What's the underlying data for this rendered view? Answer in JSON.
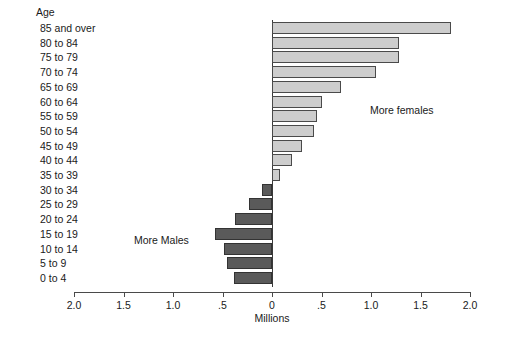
{
  "chart_data": {
    "type": "bar",
    "title": "",
    "subtitle": "",
    "orientation": "horizontal",
    "style": "population-pyramid-difference",
    "xlabel": "Millions",
    "ylabel": "Age",
    "grid": false,
    "legend_position": "none",
    "axis_tick_labels": [
      "2.0",
      "1.5",
      "1.0",
      ".5",
      "0",
      ".5",
      "1.0",
      "1.5",
      "2.0"
    ],
    "axis_tick_values": [
      -2.0,
      -1.5,
      -1.0,
      -0.5,
      0,
      0.5,
      1.0,
      1.5,
      2.0
    ],
    "xlim": [
      -2.0,
      2.0
    ],
    "categories": [
      "85 and over",
      "80 to 84",
      "75 to 79",
      "70 to 74",
      "65 to 69",
      "60 to 64",
      "55 to 59",
      "50 to 54",
      "45 to 49",
      "40 to 44",
      "35 to 39",
      "30 to 34",
      "25 to 29",
      "20 to 24",
      "15 to 19",
      "10 to 14",
      "5 to 9",
      "0 to 4"
    ],
    "values": [
      1.81,
      1.28,
      1.28,
      1.05,
      0.7,
      0.5,
      0.45,
      0.42,
      0.3,
      0.2,
      0.08,
      -0.1,
      -0.23,
      -0.37,
      -0.58,
      -0.48,
      -0.45,
      -0.38
    ],
    "value_sign_meaning": {
      "positive": "More females",
      "negative": "More Males"
    },
    "annotations": [
      {
        "text": "More females",
        "side": "right"
      },
      {
        "text": "More Males",
        "side": "left"
      }
    ],
    "colors": {
      "female_bar_fill": "#cdcdcd",
      "male_bar_fill": "#5a5a5a",
      "bar_border": "#4a4a4a",
      "axis": "#4a4a4a",
      "text": "#1a1a1a",
      "background": "#ffffff"
    }
  }
}
